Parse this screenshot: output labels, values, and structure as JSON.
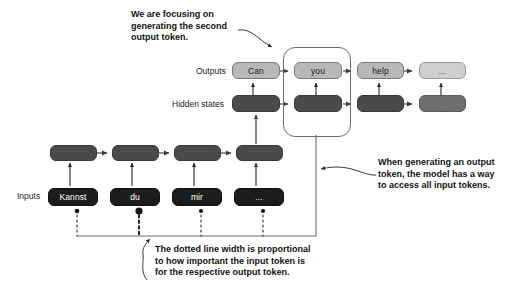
{
  "diagram": {
    "row_labels": {
      "outputs": "Outputs",
      "hidden_states": "Hidden states",
      "inputs": "Inputs"
    },
    "outputs": [
      {
        "label": "Can",
        "state": "active"
      },
      {
        "label": "you",
        "state": "active"
      },
      {
        "label": "help",
        "state": "active"
      },
      {
        "label": "...",
        "state": "dim"
      }
    ],
    "decoder_hidden": [
      {
        "label": "",
        "state": "active"
      },
      {
        "label": "",
        "state": "active"
      },
      {
        "label": "",
        "state": "active"
      },
      {
        "label": "...",
        "state": "dim"
      }
    ],
    "encoder_hidden": [
      {
        "label": "",
        "state": "active"
      },
      {
        "label": "",
        "state": "active"
      },
      {
        "label": "",
        "state": "active"
      },
      {
        "label": "",
        "state": "active"
      }
    ],
    "inputs": [
      {
        "label": "Kannst",
        "weight": "small"
      },
      {
        "label": "du",
        "weight": "large"
      },
      {
        "label": "mir",
        "weight": "small"
      },
      {
        "label": "...",
        "weight": "small"
      }
    ],
    "callouts": {
      "top": "We are focusing on\ngenerating the second\noutput token.",
      "right": "When generating an output\ntoken, the model has a way\nto access all input tokens.",
      "bottom": "The dotted line width is proportional\nto how important the input token is\nfor the respective output token."
    },
    "focus": {
      "column_index": 1,
      "description": "highlight-box-around-second-output-column"
    },
    "colors": {
      "output_active": "#b8b8b8",
      "output_dim": "#cfcfcf",
      "hidden_active": "#4a4a4a",
      "hidden_dim": "#6e6e6e",
      "input": "#1c1c1c",
      "stroke": "#6d6d6d",
      "text": "#111111",
      "background": "#ffffff"
    }
  }
}
